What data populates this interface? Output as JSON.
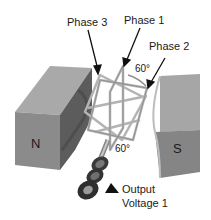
{
  "diagram": {
    "labels": {
      "phase3": "Phase 3",
      "phase1": "Phase 1",
      "phase2": "Phase 2",
      "angle_top": "60°",
      "angle_bottom": "60°",
      "output_line1": "Output",
      "output_line2": "Voltage 1"
    },
    "magnets": {
      "north": "N",
      "south": "S"
    },
    "colors": {
      "magnet_front": "#8a8a8a",
      "magnet_top": "#a8a8a8",
      "magnet_side": "#5e5e5e",
      "coil": "#b5b5b5",
      "coil_edge": "#7a7a7a",
      "text": "#1a1a1a",
      "background": "#ffffff"
    }
  }
}
